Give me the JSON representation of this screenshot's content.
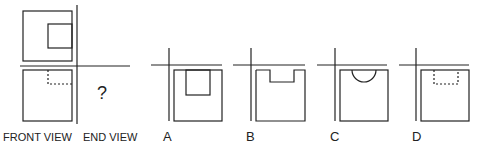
{
  "problem": {
    "type": "orthographic-projection",
    "question_mark": "?",
    "labels": {
      "front_view": "FRONT VIEW",
      "end_view": "END VIEW"
    },
    "options": [
      {
        "letter": "A",
        "feature": "square notch (solid)"
      },
      {
        "letter": "B",
        "feature": "shallow rectangular notch (solid)"
      },
      {
        "letter": "C",
        "feature": "semicircular notch (solid)"
      },
      {
        "letter": "D",
        "feature": "rectangular hidden feature (dashed)"
      }
    ]
  },
  "colors": {
    "line": "#222222",
    "background": "#ffffff"
  }
}
